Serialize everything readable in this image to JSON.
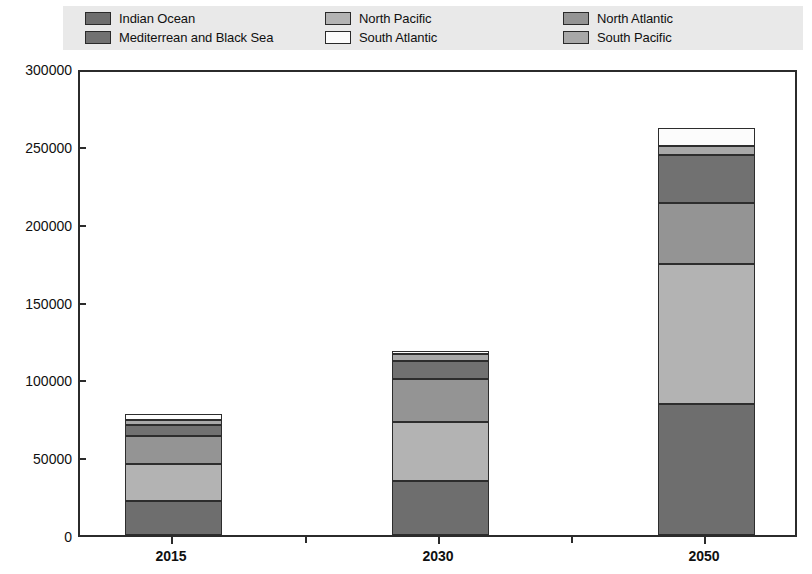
{
  "legend": {
    "columns": [
      [
        {
          "label": "Indian Ocean",
          "color": "#6e6e6e",
          "key": "indian_ocean"
        },
        {
          "label": "Mediterrean and Black Sea",
          "color": "#717171",
          "key": "mediterranean_black_sea"
        }
      ],
      [
        {
          "label": "North Pacific",
          "color": "#b3b3b3",
          "key": "north_pacific"
        },
        {
          "label": "South Atlantic",
          "color": "#fcfcfc",
          "key": "south_atlantic"
        }
      ],
      [
        {
          "label": "North Atlantic",
          "color": "#949494",
          "key": "north_atlantic"
        },
        {
          "label": "South Pacific",
          "color": "#a8a8a8",
          "key": "south_pacific"
        }
      ]
    ]
  },
  "axes": {
    "y_ticks": [
      "300000",
      "250000",
      "200000",
      "150000",
      "100000",
      "50000",
      "0"
    ],
    "y_tick_values": [
      300000,
      250000,
      200000,
      150000,
      100000,
      50000,
      0
    ],
    "x_ticks": [
      "2015",
      "2030",
      "2050"
    ]
  },
  "chart_data": {
    "type": "bar",
    "stacked": true,
    "title": "",
    "xlabel": "",
    "ylabel": "",
    "ylim": [
      0,
      300000
    ],
    "grid": false,
    "legend_position": "top",
    "categories": [
      "2015",
      "2030",
      "2050"
    ],
    "series": [
      {
        "name": "Indian Ocean",
        "color": "#6e6e6e",
        "values": [
          22000,
          35000,
          84000
        ]
      },
      {
        "name": "North Pacific",
        "color": "#b3b3b3",
        "values": [
          23500,
          37500,
          90000
        ]
      },
      {
        "name": "North Atlantic",
        "color": "#949494",
        "values": [
          18000,
          28000,
          39000
        ]
      },
      {
        "name": "Mediterrean and Black Sea",
        "color": "#717171",
        "values": [
          7000,
          11500,
          31000
        ]
      },
      {
        "name": "South Pacific",
        "color": "#a8a8a8",
        "values": [
          3500,
          4000,
          6000
        ]
      },
      {
        "name": "South Atlantic",
        "color": "#fcfcfc",
        "values": [
          3700,
          2000,
          11500
        ]
      }
    ],
    "totals": [
      77700,
      118000,
      261500
    ]
  }
}
